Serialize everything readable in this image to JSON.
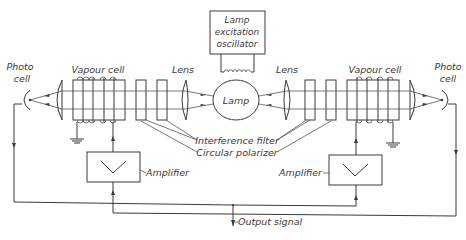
{
  "diagram": {
    "type": "block-schematic",
    "title": "",
    "labels": {
      "oscillator_line1": "Lamp",
      "oscillator_line2": "excitation",
      "oscillator_line3": "oscillator",
      "lamp": "Lamp",
      "lens_left": "Lens",
      "lens_right": "Lens",
      "vapour_cell_left": "Vapour cell",
      "vapour_cell_right": "Vapour cell",
      "photo_cell_left_line1": "Photo",
      "photo_cell_left_line2": "cell",
      "photo_cell_right_line1": "Photo",
      "photo_cell_right_line2": "cell",
      "interference_filter": "Interference filter",
      "circular_polarizer": "Circular polarizer",
      "amplifier_left": "Amplifier",
      "amplifier_right": "Amplifier",
      "output_signal": "Output signal"
    },
    "components": [
      {
        "id": "lamp-excitation-oscillator",
        "kind": "box"
      },
      {
        "id": "coil",
        "kind": "inductor"
      },
      {
        "id": "lamp",
        "kind": "circle"
      },
      {
        "id": "lens-left",
        "kind": "lens"
      },
      {
        "id": "lens-right",
        "kind": "lens"
      },
      {
        "id": "interference-filter-left",
        "kind": "plate"
      },
      {
        "id": "circular-polarizer-left",
        "kind": "plate"
      },
      {
        "id": "interference-filter-right",
        "kind": "plate"
      },
      {
        "id": "circular-polarizer-right",
        "kind": "plate"
      },
      {
        "id": "vapour-cell-left",
        "kind": "cell-with-coil"
      },
      {
        "id": "vapour-cell-right",
        "kind": "cell-with-coil"
      },
      {
        "id": "collector-lens-left",
        "kind": "lens"
      },
      {
        "id": "collector-lens-right",
        "kind": "lens"
      },
      {
        "id": "photo-cell-left",
        "kind": "detector"
      },
      {
        "id": "photo-cell-right",
        "kind": "detector"
      },
      {
        "id": "amplifier-left",
        "kind": "amplifier"
      },
      {
        "id": "amplifier-right",
        "kind": "amplifier"
      },
      {
        "id": "ground-left",
        "kind": "ground"
      },
      {
        "id": "ground-right",
        "kind": "ground"
      }
    ]
  }
}
